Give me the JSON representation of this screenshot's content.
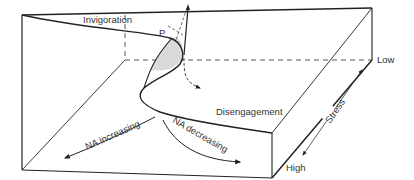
{
  "diagram": {
    "type": "3d-surface-box",
    "labels": {
      "invigoration": "Invigoration",
      "disengagement": "Disengagement",
      "point_p": "P",
      "low": "Low",
      "high": "High",
      "stress": "Stress",
      "na_increasing": "NA increasing",
      "na_decreasing": "NA decreasing"
    },
    "colors": {
      "line": "#222222",
      "text": "#333333",
      "fold_fill": "#d9d9d9"
    }
  }
}
